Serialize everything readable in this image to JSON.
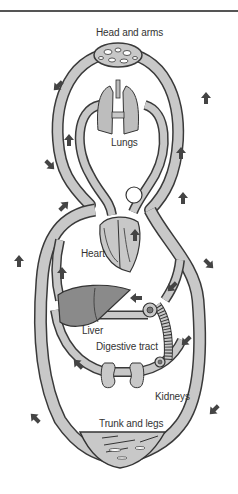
{
  "diagram": {
    "title": "",
    "type": "circulatory system schematic",
    "labels": {
      "head_and_arms": "Head and arms",
      "lungs": "Lungs",
      "heart": "Heart",
      "liver": "Liver",
      "digestive_tract": "Digestive tract",
      "kidneys": "Kidneys",
      "trunk_and_legs": "Trunk and legs"
    },
    "colors": {
      "vessel_fill": "#c8c8c8",
      "vessel_outline": "#3a3a3a",
      "organ_fill": "#bdbdbd",
      "liver_fill": "#8a8a8a",
      "arrow": "#444444",
      "background": "#ffffff"
    },
    "arrows": [
      {
        "id": "head-left",
        "direction": "down-left"
      },
      {
        "id": "head-right",
        "direction": "up"
      },
      {
        "id": "lung-left",
        "direction": "up"
      },
      {
        "id": "lung-right",
        "direction": "up"
      },
      {
        "id": "left-upper",
        "direction": "down-right"
      },
      {
        "id": "heart-left",
        "direction": "up-right"
      },
      {
        "id": "heart-right",
        "direction": "up"
      },
      {
        "id": "heart-inner",
        "direction": "up"
      },
      {
        "id": "left-mid",
        "direction": "up-right"
      },
      {
        "id": "liver-up",
        "direction": "up"
      },
      {
        "id": "right-mid",
        "direction": "down-right"
      },
      {
        "id": "gut-in",
        "direction": "down-left"
      },
      {
        "id": "portal",
        "direction": "left"
      },
      {
        "id": "gut-right",
        "direction": "down-left"
      },
      {
        "id": "kidney-left",
        "direction": "left"
      },
      {
        "id": "trunk-left",
        "direction": "up-left"
      },
      {
        "id": "trunk-right",
        "direction": "down-left"
      }
    ]
  }
}
